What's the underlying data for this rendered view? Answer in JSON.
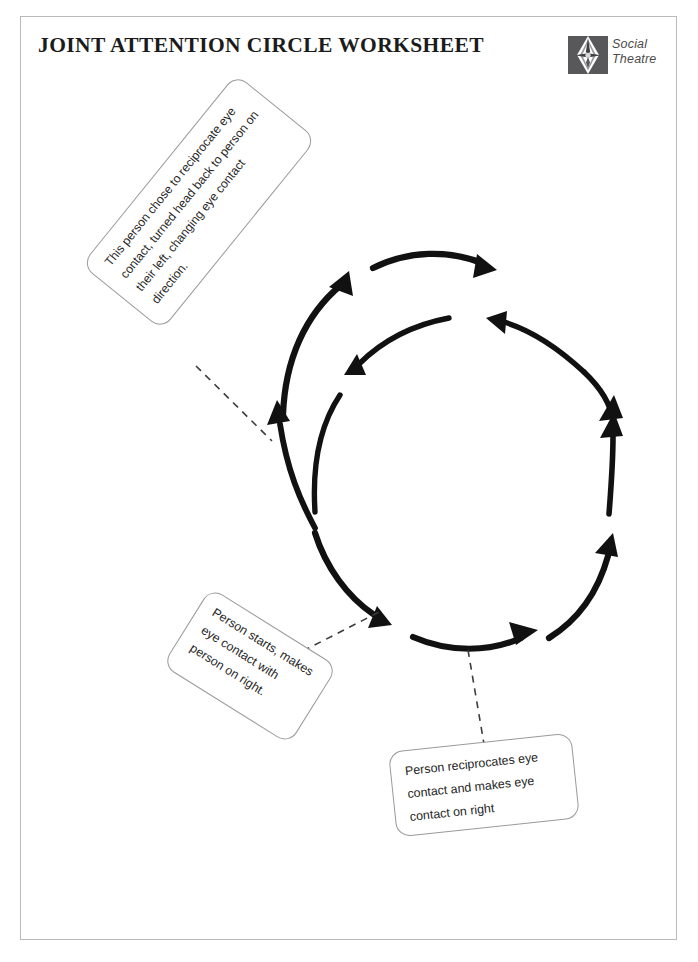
{
  "page": {
    "title": "JOINT ATTENTION CIRCLE WORKSHEET",
    "background_color": "#ffffff",
    "border_color": "#b9b9bd",
    "ink_color": "#111111"
  },
  "brand": {
    "logo_icon": "social-theatre-diamond-mark",
    "line1": "Social",
    "line2": "Theatre",
    "mark_color": "#58585b",
    "text_color": "#4a4a4a"
  },
  "callouts": [
    {
      "id": "reciprocate-direction",
      "text": "This person chose to reciprocate eye contact, turned head back to person on their left, changing eye contact direction.",
      "rotation_deg": -51
    },
    {
      "id": "person-starts",
      "text": "Person starts, makes eye contact with person on right.",
      "rotation_deg": 32
    },
    {
      "id": "person-reciprocates",
      "text": "Person reciprocates eye contact and makes eye contact on right",
      "rotation_deg": -6
    }
  ],
  "diagram": {
    "type": "circular-arrow-cycle",
    "center": {
      "x": 458,
      "y": 448
    },
    "outer_radius": 160,
    "inner_radius": 112,
    "stroke_color": "#111111",
    "connector_style": "dashed",
    "connector_color": "#3c3c3c",
    "arrows": [
      {
        "name": "outer-upper-left-arc",
        "direction": "clockwise",
        "points_to": "up-right"
      },
      {
        "name": "outer-top-arc",
        "direction": "clockwise",
        "points_to": "right"
      },
      {
        "name": "outer-upper-right-arc",
        "direction": "clockwise",
        "points_to": "up"
      },
      {
        "name": "outer-lower-right-arc",
        "direction": "clockwise",
        "points_to": "up"
      },
      {
        "name": "outer-bottom-arc",
        "direction": "clockwise",
        "points_to": "right"
      },
      {
        "name": "outer-lower-left-arc",
        "direction": "clockwise",
        "points_to": "down-right"
      },
      {
        "name": "outer-left-arc",
        "direction": "clockwise",
        "points_to": "up"
      },
      {
        "name": "inner-top-arc",
        "direction": "counter-clockwise",
        "points_to": "down-left"
      },
      {
        "name": "inner-upper-right-arc",
        "direction": "counter-clockwise",
        "points_to": "left"
      },
      {
        "name": "inner-left-arc",
        "direction": "counter-clockwise",
        "points_to": "up"
      }
    ],
    "connectors": [
      {
        "name": "connector-to-reciprocate-direction",
        "from_callout": "reciprocate-direction",
        "to_arrow": "outer-left-arc"
      },
      {
        "name": "connector-to-person-starts",
        "from_callout": "person-starts",
        "to_arrow": "outer-lower-left-arc"
      },
      {
        "name": "connector-to-person-reciprocates",
        "from_callout": "person-reciprocates",
        "to_arrow": "outer-bottom-arc"
      }
    ]
  }
}
